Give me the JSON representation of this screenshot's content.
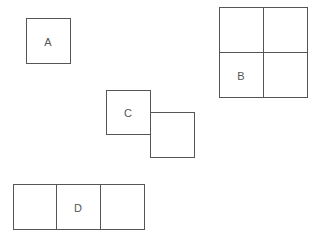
{
  "diagram": {
    "shapes": [
      {
        "id": "A",
        "label": "A",
        "grid": "1x1"
      },
      {
        "id": "B",
        "label": "B",
        "grid": "2x2",
        "labeled_cell": "bottom-left"
      },
      {
        "id": "C",
        "label": "C",
        "grid": "two offset squares",
        "labeled_cell": "upper-left"
      },
      {
        "id": "D",
        "label": "D",
        "grid": "1x3",
        "labeled_cell": "middle"
      }
    ],
    "stroke_color": "#555555",
    "background_color": "#ffffff"
  }
}
